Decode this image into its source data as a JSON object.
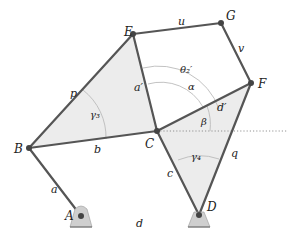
{
  "diagram": {
    "type": "linkage-mechanism",
    "colors": {
      "link": "#555555",
      "joint": "#444444",
      "triangle_fill": "#e9e9e9",
      "ground_fill": "#cfcfcf",
      "arc": "#bbbbbb",
      "reference_line": "#888888"
    },
    "points": {
      "A": {
        "label": "A",
        "x": 81,
        "y": 216
      },
      "B": {
        "label": "B",
        "x": 29,
        "y": 148
      },
      "C": {
        "label": "C",
        "x": 157,
        "y": 131
      },
      "D": {
        "label": "D",
        "x": 199,
        "y": 215
      },
      "E": {
        "label": "E",
        "x": 133,
        "y": 34
      },
      "F": {
        "label": "F",
        "x": 251,
        "y": 83
      },
      "G": {
        "label": "G",
        "x": 221,
        "y": 23
      }
    },
    "links": {
      "a": "a",
      "b": "b",
      "c": "c",
      "d": "d",
      "p": "p",
      "q": "q",
      "u": "u",
      "v": "v",
      "a_prime": "a′",
      "d_prime": "d′"
    },
    "angles": {
      "theta2_prime": "θ₂′",
      "alpha": "α",
      "beta": "β",
      "gamma3": "γ₃",
      "gamma4": "γ₄"
    }
  }
}
